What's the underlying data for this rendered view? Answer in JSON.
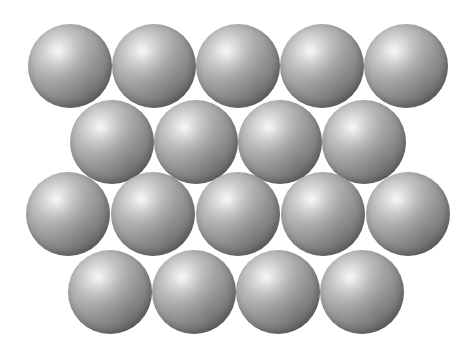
{
  "figure": {
    "name": "close-packed-sphere-layer",
    "canvas": {
      "width": 471,
      "height": 355
    },
    "background_color": "#ffffff",
    "caption": "",
    "render": {
      "sphere_diameter": 84,
      "highlight_color": "#fdfdfd",
      "midtone_color": "#9b9b9b",
      "edge_color": "#585858",
      "highlight_position": "37% 33%",
      "texture": "halftone-dither"
    },
    "rows": [
      {
        "id": "row-1",
        "label": "Top row",
        "sphere_count": 5,
        "y": 24,
        "x_start": 28,
        "x_step": 84,
        "spheres": [
          {
            "id": "s1-1",
            "cx": 70,
            "cy": 66,
            "r": 42
          },
          {
            "id": "s1-2",
            "cx": 154,
            "cy": 66,
            "r": 42
          },
          {
            "id": "s1-3",
            "cx": 238,
            "cy": 66,
            "r": 42
          },
          {
            "id": "s1-4",
            "cx": 322,
            "cy": 66,
            "r": 42
          },
          {
            "id": "s1-5",
            "cx": 406,
            "cy": 66,
            "r": 42
          }
        ]
      },
      {
        "id": "row-2",
        "label": "Second row",
        "sphere_count": 4,
        "y": 100,
        "x_start": 70,
        "x_step": 84,
        "spheres": [
          {
            "id": "s2-1",
            "cx": 112,
            "cy": 142,
            "r": 42
          },
          {
            "id": "s2-2",
            "cx": 196,
            "cy": 142,
            "r": 42
          },
          {
            "id": "s2-3",
            "cx": 280,
            "cy": 142,
            "r": 42
          },
          {
            "id": "s2-4",
            "cx": 364,
            "cy": 142,
            "r": 42
          }
        ]
      },
      {
        "id": "row-3",
        "label": "Third row",
        "sphere_count": 5,
        "y": 172,
        "x_start": 26,
        "x_step": 85,
        "spheres": [
          {
            "id": "s3-1",
            "cx": 68,
            "cy": 214,
            "r": 42
          },
          {
            "id": "s3-2",
            "cx": 153,
            "cy": 214,
            "r": 42
          },
          {
            "id": "s3-3",
            "cx": 238,
            "cy": 214,
            "r": 42
          },
          {
            "id": "s3-4",
            "cx": 323,
            "cy": 214,
            "r": 42
          },
          {
            "id": "s3-5",
            "cx": 408,
            "cy": 214,
            "r": 42
          }
        ]
      },
      {
        "id": "row-4",
        "label": "Bottom row",
        "sphere_count": 4,
        "y": 250,
        "x_start": 68,
        "x_step": 84,
        "spheres": [
          {
            "id": "s4-1",
            "cx": 110,
            "cy": 292,
            "r": 42
          },
          {
            "id": "s4-2",
            "cx": 194,
            "cy": 292,
            "r": 42
          },
          {
            "id": "s4-3",
            "cx": 278,
            "cy": 292,
            "r": 42
          },
          {
            "id": "s4-4",
            "cx": 362,
            "cy": 292,
            "r": 42
          }
        ]
      }
    ],
    "total_spheres": 18
  }
}
